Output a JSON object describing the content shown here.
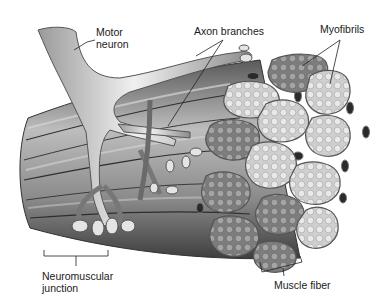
{
  "figure": {
    "labels": {
      "motor_neuron_line1": "Motor",
      "motor_neuron_line2": "neuron",
      "axon_branches": "Axon branches",
      "myofibrils": "Myofibrils",
      "neuromuscular_line1": "Neuromuscular",
      "neuromuscular_line2": "junction",
      "muscle_fiber": "Muscle fiber"
    },
    "colors": {
      "background": "#ffffff",
      "text": "#1a1a1a",
      "leader_line": "#222222",
      "fiber_dark": "#6e6e6e",
      "fiber_mid": "#9a9a9a",
      "fiber_light": "#d8d8d8",
      "neuron": "#c8c8c8",
      "capillary": "#2a2a2a"
    }
  }
}
